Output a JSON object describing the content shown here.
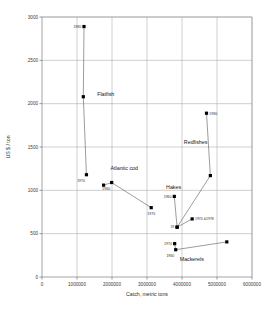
{
  "chart_data": {
    "type": "scatter",
    "title": "",
    "xlabel": "Catch, metric tons",
    "ylabel": "US $ / ton",
    "xlim": [
      0,
      6000000
    ],
    "ylim": [
      0,
      3000
    ],
    "xticks": [
      0,
      1000000,
      2000000,
      3000000,
      4000000,
      5000000,
      6000000
    ],
    "xtick_labels": [
      "0",
      "1000000",
      "2000000",
      "3000000",
      "4000000",
      "5000000",
      "6000000"
    ],
    "yticks": [
      0,
      500,
      1000,
      1500,
      2000,
      2500,
      3000
    ],
    "ytick_labels": [
      "0",
      "500",
      "1000",
      "1500",
      "2000",
      "2500",
      "3000"
    ],
    "grid": true,
    "legend": "none",
    "marker": "square",
    "series": [
      {
        "name": "Flatfish",
        "label": "Flatfish",
        "label_x": 1820000,
        "label_y": 2090,
        "points": [
          {
            "x": 1200000,
            "y": 2890,
            "label": "1980",
            "label_pos": "left"
          },
          {
            "x": 1180000,
            "y": 2080,
            "label": "",
            "label_pos": "left"
          },
          {
            "x": 1270000,
            "y": 1180,
            "label": "1970",
            "label_pos": "belowleft"
          }
        ]
      },
      {
        "name": "Atlantic cod",
        "label": "Atlantic cod",
        "label_x": 2350000,
        "label_y": 1230,
        "points": [
          {
            "x": 1760000,
            "y": 1060,
            "label": "",
            "label_pos": "left"
          },
          {
            "x": 1990000,
            "y": 1090,
            "label": "1960",
            "label_pos": "belowleft"
          },
          {
            "x": 3120000,
            "y": 800,
            "label": "1970",
            "label_pos": "below"
          }
        ]
      },
      {
        "name": "Hakes",
        "label": "Hakes",
        "label_x": 3760000,
        "label_y": 1010,
        "points": [
          {
            "x": 3780000,
            "y": 930,
            "label": "1960",
            "label_pos": "left"
          },
          {
            "x": 3860000,
            "y": 575,
            "label": "19",
            "label_pos": "left"
          },
          {
            "x": 4290000,
            "y": 670,
            "label": "1970 &1978",
            "label_pos": "right"
          }
        ]
      },
      {
        "name": "Redfishes",
        "label": "Redfishes",
        "label_x": 4390000,
        "label_y": 1530,
        "points": [
          {
            "x": 4700000,
            "y": 1890,
            "label": "1980",
            "label_pos": "right"
          },
          {
            "x": 4810000,
            "y": 1170,
            "label": "",
            "label_pos": "right"
          },
          {
            "x": 3860000,
            "y": 575,
            "label": "",
            "label_pos": "left"
          }
        ]
      },
      {
        "name": "Mackerels",
        "label": "Mackerels",
        "label_x": 4280000,
        "label_y": 180,
        "points": [
          {
            "x": 3790000,
            "y": 385,
            "label": "1970",
            "label_pos": "left"
          },
          {
            "x": 3820000,
            "y": 315,
            "label": "1960",
            "label_pos": "belowleft"
          },
          {
            "x": 5280000,
            "y": 405,
            "label": "",
            "label_pos": "right"
          }
        ]
      }
    ]
  },
  "axes": {
    "x_title": "Catch, metric tons",
    "y_title": "US $ / ton"
  }
}
